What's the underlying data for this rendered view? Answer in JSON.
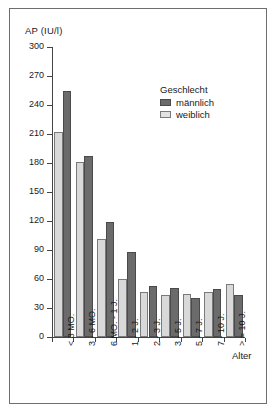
{
  "chart_data": {
    "type": "bar",
    "title": "",
    "xlabel": "Alter",
    "ylabel": "AP (IU/l)",
    "ylim": [
      0,
      300
    ],
    "yticks": [
      0,
      30,
      60,
      90,
      120,
      150,
      180,
      210,
      240,
      270,
      300
    ],
    "ytick_labels": [
      "0",
      "30",
      "60",
      "90",
      "120",
      "150",
      "180",
      "210",
      "240",
      "270",
      "300"
    ],
    "grid": false,
    "legend_title": "Geschlecht",
    "legend_position": "upper-right-inside",
    "categories": [
      "< 3 MO.",
      "3 - 6 MO.",
      "6 MO. - 1 J.",
      "1 - 2 J.",
      "2 - 3 J.",
      "3 - 5 J.",
      "5 - 7 J.",
      "7 - 10 J.",
      "> = 10 J."
    ],
    "series": [
      {
        "name": "weiblich",
        "color": "#d9d9d9",
        "values": [
          212,
          181,
          101,
          60,
          47,
          43,
          45,
          47,
          55
        ]
      },
      {
        "name": "männlich",
        "color": "#6b6b6b",
        "values": [
          255,
          187,
          119,
          88,
          53,
          51,
          40,
          50,
          43
        ]
      }
    ]
  },
  "legend": {
    "title": "Geschlecht",
    "entries": [
      {
        "label": "männlich",
        "swatch": "male"
      },
      {
        "label": "weiblich",
        "swatch": "female"
      }
    ]
  },
  "axes": {
    "y_title": "AP (IU/l)",
    "x_title": "Alter"
  }
}
